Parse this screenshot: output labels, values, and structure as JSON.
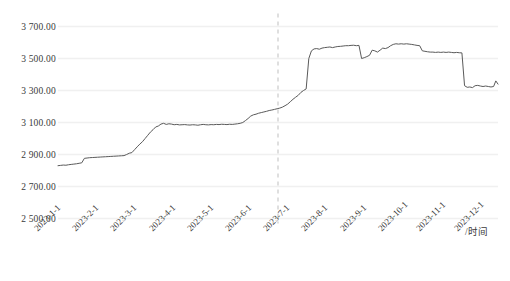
{
  "chart_data": {
    "type": "line",
    "title": "",
    "subtitle": "",
    "xlabel": "/时间",
    "ylabel": "",
    "xlim_labels": [
      "2023-1-1",
      "2023-12-1"
    ],
    "ylim": [
      2500,
      3700
    ],
    "y_ticks": [
      2500,
      2700,
      2900,
      3100,
      3300,
      3500,
      3700
    ],
    "y_tick_labels": [
      "2 500.00",
      "2 700.00",
      "2 900.00",
      "3 100.00",
      "3 300.00",
      "3 500.00",
      "3 700.00"
    ],
    "x_tick_labels": [
      "2023-1-1",
      "2023-2-1",
      "2023-3-1",
      "2023-4-1",
      "2023-5-1",
      "2023-6-1",
      "2023-7-1",
      "2023-8-1",
      "2023-9-1",
      "2023-10-1",
      "2023-11-1",
      "2023-12-1"
    ],
    "grid": true,
    "grid_axis": "y",
    "legend": false,
    "legend_position": "none",
    "line_color": "#5a5a5a",
    "grid_color": "#f0f0f0",
    "text_color": "#3a3a3a",
    "annotations": [
      {
        "name": "reference-line",
        "type": "vertical-dashed-line",
        "x_label": "2023-7-1",
        "x_fraction": 0.5,
        "color": "#bfbfbf"
      }
    ],
    "series": [
      {
        "name": "价格",
        "x": [
          0.0,
          0.006,
          0.012,
          0.018,
          0.024,
          0.03,
          0.036,
          0.042,
          0.048,
          0.054,
          0.06,
          0.066,
          0.072,
          0.078,
          0.084,
          0.09,
          0.096,
          0.102,
          0.108,
          0.114,
          0.12,
          0.126,
          0.132,
          0.138,
          0.144,
          0.15,
          0.156,
          0.162,
          0.168,
          0.174,
          0.18,
          0.186,
          0.192,
          0.198,
          0.204,
          0.21,
          0.216,
          0.222,
          0.228,
          0.234,
          0.24,
          0.246,
          0.252,
          0.258,
          0.264,
          0.27,
          0.276,
          0.282,
          0.288,
          0.294,
          0.3,
          0.306,
          0.312,
          0.318,
          0.324,
          0.33,
          0.336,
          0.342,
          0.348,
          0.354,
          0.36,
          0.366,
          0.372,
          0.378,
          0.384,
          0.39,
          0.396,
          0.402,
          0.408,
          0.414,
          0.42,
          0.426,
          0.432,
          0.438,
          0.444,
          0.45,
          0.456,
          0.462,
          0.468,
          0.474,
          0.48,
          0.486,
          0.492,
          0.498,
          0.504,
          0.51,
          0.516,
          0.522,
          0.528,
          0.534,
          0.54,
          0.546,
          0.552,
          0.558,
          0.564,
          0.57,
          0.576,
          0.582,
          0.588,
          0.594,
          0.6,
          0.606,
          0.612,
          0.618,
          0.624,
          0.63,
          0.636,
          0.642,
          0.648,
          0.654,
          0.66,
          0.666,
          0.672,
          0.678,
          0.684,
          0.69,
          0.696,
          0.702,
          0.708,
          0.714,
          0.72,
          0.726,
          0.732,
          0.738,
          0.744,
          0.75,
          0.756,
          0.762,
          0.768,
          0.774,
          0.78,
          0.786,
          0.792,
          0.798,
          0.804,
          0.81,
          0.816,
          0.822,
          0.828,
          0.834,
          0.84,
          0.846,
          0.852,
          0.858,
          0.864,
          0.87,
          0.876,
          0.882,
          0.888,
          0.894,
          0.9,
          0.906,
          0.912,
          0.918,
          0.924,
          0.93,
          0.936,
          0.942,
          0.948,
          0.954,
          0.96,
          0.966,
          0.972,
          0.978,
          0.984,
          0.99,
          0.995,
          1.0
        ],
        "values": [
          2830,
          2832,
          2834,
          2833,
          2836,
          2838,
          2840,
          2842,
          2845,
          2848,
          2876,
          2878,
          2880,
          2881,
          2882,
          2883,
          2884,
          2885,
          2886,
          2887,
          2888,
          2889,
          2890,
          2891,
          2892,
          2893,
          2900,
          2908,
          2912,
          2930,
          2948,
          2965,
          2980,
          3000,
          3020,
          3040,
          3055,
          3072,
          3078,
          3090,
          3095,
          3088,
          3092,
          3090,
          3086,
          3088,
          3085,
          3086,
          3087,
          3085,
          3084,
          3086,
          3085,
          3083,
          3086,
          3088,
          3086,
          3085,
          3087,
          3086,
          3088,
          3087,
          3089,
          3088,
          3087,
          3089,
          3088,
          3090,
          3092,
          3095,
          3100,
          3112,
          3125,
          3140,
          3148,
          3152,
          3158,
          3162,
          3166,
          3170,
          3175,
          3178,
          3182,
          3186,
          3190,
          3196,
          3205,
          3215,
          3230,
          3245,
          3258,
          3270,
          3288,
          3300,
          3310,
          3500,
          3548,
          3560,
          3562,
          3558,
          3565,
          3568,
          3570,
          3572,
          3568,
          3572,
          3575,
          3576,
          3578,
          3580,
          3580,
          3582,
          3583,
          3580,
          3582,
          3500,
          3505,
          3512,
          3520,
          3552,
          3548,
          3540,
          3552,
          3565,
          3562,
          3568,
          3580,
          3588,
          3592,
          3590,
          3592,
          3590,
          3592,
          3590,
          3588,
          3585,
          3582,
          3580,
          3548,
          3545,
          3542,
          3540,
          3540,
          3538,
          3540,
          3538,
          3540,
          3538,
          3540,
          3538,
          3536,
          3538,
          3536,
          3535,
          3330,
          3320,
          3322,
          3318,
          3330,
          3332,
          3328,
          3325,
          3328,
          3325,
          3322,
          3325,
          3360,
          3340
        ]
      }
    ]
  }
}
